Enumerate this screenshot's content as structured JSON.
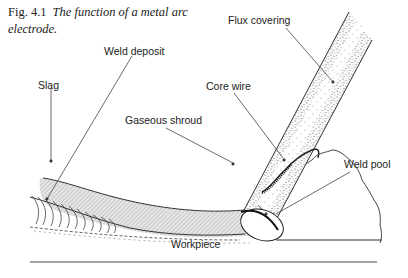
{
  "figure": {
    "number": "Fig. 4.1",
    "title": "The function of a metal arc electrode."
  },
  "labels": {
    "flux_covering": "Flux covering",
    "weld_deposit": "Weld deposit",
    "slag": "Slag",
    "core_wire": "Core wire",
    "gaseous_shroud": "Gaseous shroud",
    "weld_pool": "Weld pool",
    "workpiece": "Workpiece"
  },
  "colors": {
    "line": "#333333",
    "stipple": "#555555",
    "hatch_fill": "#d8d8d8"
  }
}
